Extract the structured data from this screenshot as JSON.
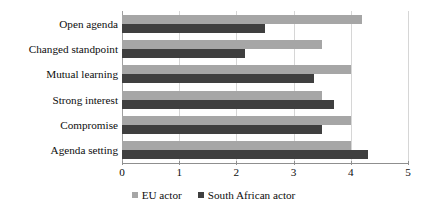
{
  "chart_data": {
    "type": "bar",
    "orientation": "horizontal",
    "title": "",
    "xlabel": "",
    "ylabel": "",
    "xlim": [
      0,
      5
    ],
    "xticks": [
      "0",
      "1",
      "2",
      "3",
      "4",
      "5"
    ],
    "grid": true,
    "legend_position": "bottom",
    "categories": [
      "Open agenda",
      "Changed standpoint",
      "Mutual learning",
      "Strong interest",
      "Compromise",
      "Agenda setting"
    ],
    "series": [
      {
        "name": "EU actor",
        "color": "#a6a6a6",
        "values": [
          4.2,
          3.5,
          4.0,
          3.5,
          4.0,
          4.0
        ]
      },
      {
        "name": "South African actor",
        "color": "#3f3f3f",
        "values": [
          2.5,
          2.15,
          3.35,
          3.7,
          3.5,
          4.3
        ]
      }
    ]
  },
  "legend": {
    "entries": [
      {
        "label": "EU actor",
        "color": "#a6a6a6",
        "marker": "square-marker"
      },
      {
        "label": "South African actor",
        "color": "#3f3f3f",
        "marker": "square-marker"
      }
    ]
  }
}
